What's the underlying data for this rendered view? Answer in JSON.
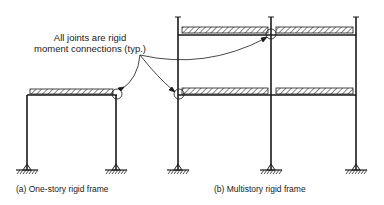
{
  "annotation": {
    "line1": "All joints are rigid",
    "line2": "moment connections (typ.)"
  },
  "figures": [
    {
      "id": "a",
      "caption": "(a)  One-story rigid frame",
      "stories": 1,
      "bays": 1
    },
    {
      "id": "b",
      "caption": "(b)  Multistory rigid frame",
      "stories": 2,
      "bays": 2
    }
  ],
  "colors": {
    "line": "#1a1a1a",
    "background": "#ffffff"
  }
}
